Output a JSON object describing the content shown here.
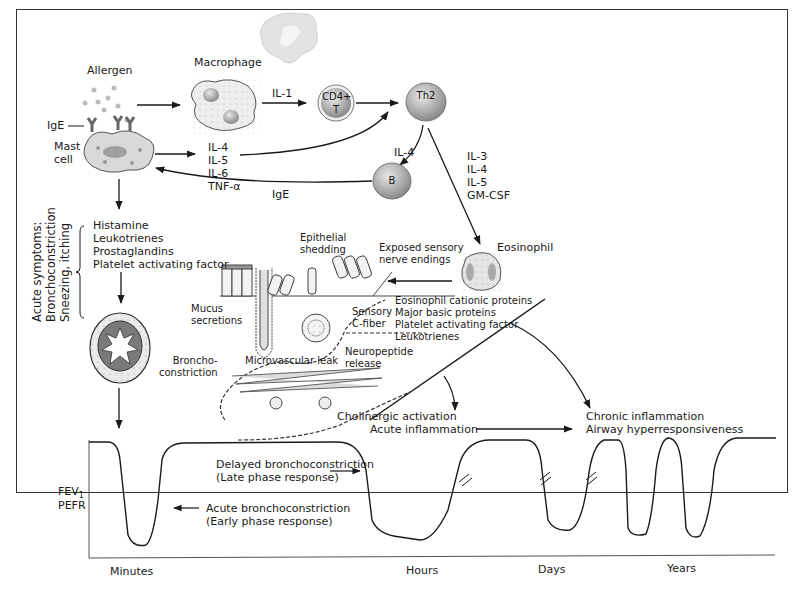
{
  "diagram": {
    "cells": {
      "allergen": "Allergen",
      "macrophage": "Macrophage",
      "mast_cell": [
        "Mast",
        "cell"
      ],
      "ige_receptor": "IgE",
      "cd4_t": [
        "CD4+",
        "T"
      ],
      "th2": "Th2",
      "b_cell": "B",
      "eosinophil": "Eosinophil"
    },
    "signals": {
      "macrophage_to_cd4": "IL-1",
      "mast_cytokines": [
        "IL-4",
        "IL-5",
        "IL-6",
        "TNF-α"
      ],
      "th2_to_b": "IL-4",
      "b_to_mast": "IgE",
      "th2_to_eosinophil": [
        "IL-3",
        "IL-4",
        "IL-5",
        "GM-CSF"
      ]
    },
    "mediators": {
      "mast_mediators": [
        "Histamine",
        "Leukotrienes",
        "Prostaglandins",
        "Platelet activating factor"
      ],
      "eosinophil_mediators": [
        "Eosinophil cationic proteins",
        "Major basic proteins",
        "Platelet activating factor",
        "Leukotrienes"
      ]
    },
    "acute_symptoms": [
      "Acute symptoms:",
      "Bronchoconstriction",
      "Sneezing, itching"
    ],
    "airway_labels": {
      "epithelial_shedding": [
        "Epithelial",
        "shedding"
      ],
      "exposed_nerves": [
        "Exposed sensory",
        "nerve endings"
      ],
      "mucus": [
        "Mucus",
        "secretions"
      ],
      "sensory_fiber": [
        "Sensory",
        "C-fiber"
      ],
      "microvascular_leak": "Microvascular leak",
      "neuropeptide": [
        "Neuropeptide",
        "release"
      ],
      "bronchoconstriction": [
        "Broncho-",
        "constriction"
      ],
      "cholinergic": "Cholinergic activation",
      "acute_inflammation": "Acute inflammation",
      "chronic": [
        "Chronic inflammation",
        "Airway hyperresponsiveness"
      ]
    },
    "graph": {
      "y_label_1": "FEV",
      "y_label_1_sub": "1",
      "y_label_2": "PEFR",
      "late_phase": [
        "Delayed bronchoconstriction",
        "(Late phase response)"
      ],
      "early_phase": [
        "Acute bronchoconstriction",
        "(Early phase response)"
      ],
      "x_labels": [
        "Minutes",
        "Hours",
        "Days",
        "Years"
      ]
    },
    "colors": {
      "line": "#1a1a1a",
      "cell_fill": "#d9d9d9",
      "cell_dark": "#8c8c8c",
      "background": "#ffffff"
    }
  }
}
